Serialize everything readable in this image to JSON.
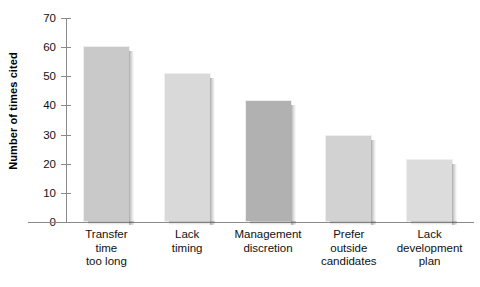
{
  "chart_data": {
    "type": "bar",
    "title": "",
    "xlabel": "",
    "ylabel": "Number of times cited",
    "categories": [
      "Transfer time too long",
      "Lack timing",
      "Management discretion",
      "Prefer outside candidates",
      "Lack development plan"
    ],
    "category_lines": [
      [
        "Transfer",
        "time",
        "too long"
      ],
      [
        "Lack",
        "timing"
      ],
      [
        "Management",
        "discretion"
      ],
      [
        "Prefer",
        "outside",
        "candidates"
      ],
      [
        "Lack",
        "development",
        "plan"
      ]
    ],
    "values": [
      60.5,
      51,
      42,
      30,
      21.5
    ],
    "bar_colors": [
      "#c9c9c9",
      "#d9d9d9",
      "#b1b1b1",
      "#d2d2d2",
      "#dcdcdc"
    ],
    "ylim": [
      0,
      70
    ],
    "yticks": [
      0,
      10,
      20,
      30,
      40,
      50,
      60,
      70
    ],
    "ytick_labels": [
      "0",
      "10",
      "20",
      "30",
      "40",
      "50",
      "60",
      "70"
    ],
    "grid": false,
    "legend": null
  },
  "axis": {
    "y_title": "Number of times cited"
  },
  "colors": {
    "axis": "#8a8a8a",
    "text": "#111111",
    "background": "#ffffff"
  }
}
